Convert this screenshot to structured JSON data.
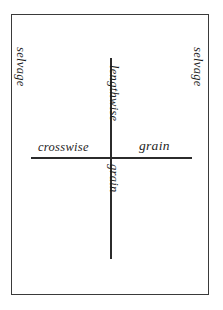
{
  "diagram": {
    "background_color": "#ffffff",
    "border_color": "#3a3a3a",
    "line_color": "#2b2b2b",
    "text_color": "#1e1e1e",
    "labels": {
      "selvage_left": "selvage",
      "selvage_right": "selvage",
      "lengthwise": "lengthwise",
      "grain_vertical": "grain",
      "crosswise": "crosswise",
      "grain_horizontal": "grain"
    },
    "lines": {
      "lengthwise_grain": "vertical-grain-line",
      "crosswise_grain": "horizontal-grain-line"
    }
  }
}
